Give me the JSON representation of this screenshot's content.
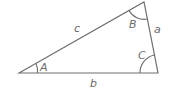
{
  "diagram": {
    "type": "triangle",
    "vertices": {
      "A": {
        "x": 19,
        "y": 73
      },
      "B": {
        "x": 144,
        "y": 2
      },
      "C": {
        "x": 158,
        "y": 73
      }
    },
    "side_labels": {
      "a": "a",
      "b": "b",
      "c": "c"
    },
    "angle_labels": {
      "A": "A",
      "B": "B",
      "C": "C"
    },
    "colors": {
      "line": "#6e6e6e",
      "text": "#6a6a6a",
      "background": "#ffffff"
    }
  }
}
